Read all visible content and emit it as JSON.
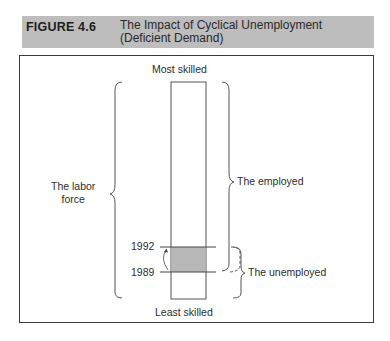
{
  "figure": {
    "number": "FIGURE 4.6",
    "title_line1": "The Impact of Cyclical Unemployment",
    "title_line2": "(Deficient Demand)"
  },
  "diagram": {
    "top_label": "Most skilled",
    "bottom_label": "Least skilled",
    "left_brace_label_line1": "The labor",
    "left_brace_label_line2": "force",
    "right_upper_brace_label": "The employed",
    "right_lower_brace_label": "The unemployed",
    "year_upper": "1992",
    "year_lower": "1989",
    "colors": {
      "header_bg": "#bdbdbd",
      "shaded_band": "#b8b8b8",
      "lines": "#444444"
    }
  }
}
